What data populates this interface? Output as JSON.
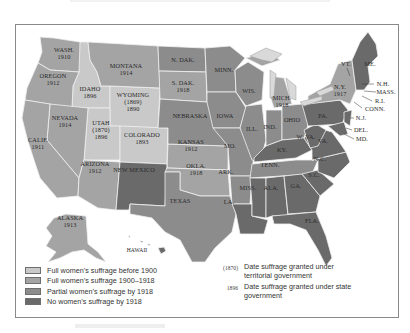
{
  "map": {
    "colors": {
      "before_1900": "#c9c9c9",
      "1900_1918": "#a4a4a4",
      "partial_1918": "#8c8c8c",
      "none_1918": "#6a6a6a",
      "lakes": "#d9d9d9",
      "border": "#f2f2f2"
    },
    "states": [
      {
        "name": "WASH.",
        "year": "1910"
      },
      {
        "name": "OREGON",
        "year": "1912"
      },
      {
        "name": "IDAHO",
        "year": "1896"
      },
      {
        "name": "MONTANA",
        "year": "1914"
      },
      {
        "name": "WYOMING",
        "territorial": "(1869)",
        "year": "1890"
      },
      {
        "name": "NEVADA",
        "year": "1914"
      },
      {
        "name": "UTAH",
        "territorial": "(1870)",
        "year": "1896"
      },
      {
        "name": "CALIF.",
        "year": "1911"
      },
      {
        "name": "COLORADO",
        "year": "1893"
      },
      {
        "name": "ARIZONA",
        "year": "1912"
      },
      {
        "name": "NEW MEXICO"
      },
      {
        "name": "N. DAK."
      },
      {
        "name": "S. DAK.",
        "year": "1918"
      },
      {
        "name": "NEBRASKA"
      },
      {
        "name": "KANSAS",
        "year": "1912"
      },
      {
        "name": "OKLA.",
        "year": "1918"
      },
      {
        "name": "TEXAS"
      },
      {
        "name": "MINN."
      },
      {
        "name": "IOWA"
      },
      {
        "name": "MO."
      },
      {
        "name": "ARK."
      },
      {
        "name": "LA."
      },
      {
        "name": "WIS."
      },
      {
        "name": "ILL."
      },
      {
        "name": "MICH.",
        "year": "1918"
      },
      {
        "name": "IND."
      },
      {
        "name": "OHIO"
      },
      {
        "name": "KY."
      },
      {
        "name": "TENN."
      },
      {
        "name": "MISS."
      },
      {
        "name": "ALA."
      },
      {
        "name": "GA."
      },
      {
        "name": "FLA."
      },
      {
        "name": "S.C."
      },
      {
        "name": "N.C."
      },
      {
        "name": "VA."
      },
      {
        "name": "W. VA."
      },
      {
        "name": "PA."
      },
      {
        "name": "N.Y.",
        "year": "1917"
      },
      {
        "name": "VT."
      },
      {
        "name": "ME."
      },
      {
        "name": "N.H."
      },
      {
        "name": "MASS."
      },
      {
        "name": "R.I."
      },
      {
        "name": "CONN."
      },
      {
        "name": "N.J."
      },
      {
        "name": "DEL."
      },
      {
        "name": "MD."
      },
      {
        "name": "ALASKA",
        "year": "1913"
      },
      {
        "name": "HAWAII"
      }
    ]
  },
  "legend": {
    "items": [
      {
        "label": "Full women’s suffrage before 1900",
        "color": "#c9c9c9"
      },
      {
        "label": "Full women’s suffrage 1900–1918",
        "color": "#a4a4a4"
      },
      {
        "label": "Partial women’s suffrage by 1918",
        "color": "#8c8c8c"
      },
      {
        "label": "No women’s suffrage by 1918",
        "color": "#6a6a6a"
      }
    ],
    "notes": [
      {
        "key": "(1870)",
        "text": "Date suffrage granted under territorial government"
      },
      {
        "key": "1896",
        "text": "Date suffrage granted under state government"
      }
    ]
  }
}
